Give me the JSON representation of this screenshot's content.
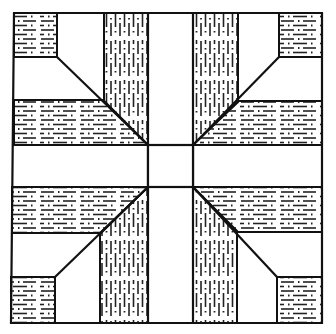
{
  "diagram": {
    "type": "quilt-block",
    "colors": {
      "background": "#ffffff",
      "line": "#111111",
      "texture": "#222222"
    },
    "center_square": {
      "x": 148,
      "y": 145,
      "w": 45,
      "h": 42
    },
    "corner_squares": [
      "top-left",
      "top-right",
      "bottom-left",
      "bottom-right"
    ],
    "textured_strips": {
      "vertical": [
        "top-left",
        "top-right",
        "bottom-left",
        "bottom-right"
      ],
      "horizontal": [
        "left-top",
        "left-bottom",
        "right-top",
        "right-bottom"
      ]
    }
  }
}
